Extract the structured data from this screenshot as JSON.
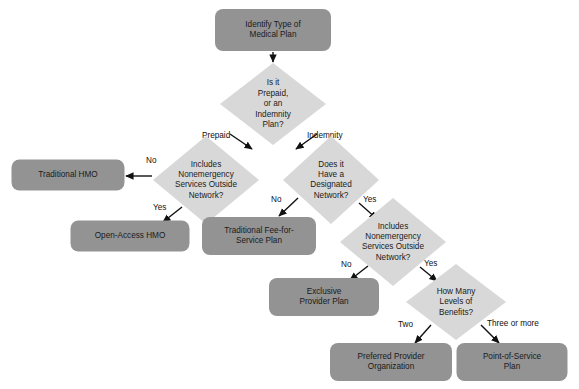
{
  "diagram": {
    "colors": {
      "background": "#ffffff",
      "terminal_fill": "#939393",
      "decision_fill": "#d8d8d8",
      "text": "#1a1a1a",
      "connector": "#111111"
    },
    "nodes": [
      {
        "id": "start",
        "type": "terminal",
        "lines": [
          "Identify Type of",
          "Medical Plan"
        ],
        "x": 273,
        "y": 30,
        "w": 116,
        "h": 42
      },
      {
        "id": "d1",
        "type": "decision",
        "lines": [
          "Is it",
          "Prepaid,",
          "or an",
          "Indemnity",
          "Plan?"
        ],
        "x": 273,
        "y": 104,
        "rx": 53,
        "ry": 41
      },
      {
        "id": "d2",
        "type": "decision",
        "lines": [
          "Includes",
          "Nonemergency",
          "Services Outside",
          "Network?"
        ],
        "x": 206,
        "y": 180,
        "rx": 53,
        "ry": 44
      },
      {
        "id": "d3",
        "type": "decision",
        "lines": [
          "Does it",
          "Have a",
          "Designated",
          "Network?"
        ],
        "x": 331,
        "y": 180,
        "rx": 48,
        "ry": 44
      },
      {
        "id": "trad-hmo",
        "type": "terminal",
        "lines": [
          "Traditional HMO"
        ],
        "x": 68,
        "y": 175,
        "w": 113,
        "h": 31
      },
      {
        "id": "open-hmo",
        "type": "terminal",
        "lines": [
          "Open-Access HMO"
        ],
        "x": 130,
        "y": 236,
        "w": 119,
        "h": 31
      },
      {
        "id": "ffs",
        "type": "terminal",
        "lines": [
          "Traditional Fee-for-",
          "Service Plan"
        ],
        "x": 259,
        "y": 236,
        "w": 114,
        "h": 38
      },
      {
        "id": "d4",
        "type": "decision",
        "lines": [
          "Includes",
          "Nonemergency",
          "Services Outside",
          "Network?"
        ],
        "x": 393,
        "y": 242,
        "rx": 53,
        "ry": 44
      },
      {
        "id": "epp",
        "type": "terminal",
        "lines": [
          "Exclusive",
          "Provider Plan"
        ],
        "x": 324,
        "y": 297,
        "w": 110,
        "h": 38
      },
      {
        "id": "d5",
        "type": "decision",
        "lines": [
          "How Many",
          "Levels of",
          "Benefits?"
        ],
        "x": 456,
        "y": 302,
        "rx": 50,
        "ry": 38
      },
      {
        "id": "ppo",
        "type": "terminal",
        "lines": [
          "Preferred Provider",
          "Organization"
        ],
        "x": 391,
        "y": 362,
        "w": 122,
        "h": 38
      },
      {
        "id": "pos",
        "type": "terminal",
        "lines": [
          "Point-of-Service",
          "Plan"
        ],
        "x": 512,
        "y": 362,
        "w": 111,
        "h": 38
      }
    ],
    "edges": [
      {
        "id": "e-start-d1",
        "from": "start",
        "to": "d1",
        "path": "M 273 52 L 273 62",
        "label": ""
      },
      {
        "id": "e-d1-d2",
        "from": "d1",
        "to": "d2",
        "path": "M 230 134 L 252 149",
        "label": "Prepaid",
        "label_x": 202,
        "label_y": 136
      },
      {
        "id": "e-d1-d3",
        "from": "d1",
        "to": "d3",
        "path": "M 317 134 L 296 149",
        "label": "Indemnity",
        "label_x": 307,
        "label_y": 136
      },
      {
        "id": "e-d2-tradhmo",
        "from": "d2",
        "to": "trad-hmo",
        "path": "M 152 176 L 126 176",
        "label": "No",
        "label_x": 146,
        "label_y": 161
      },
      {
        "id": "e-d2-openhmo",
        "from": "d2",
        "to": "open-hmo",
        "path": "M 182 207 L 163 222",
        "label": "Yes",
        "label_x": 153,
        "label_y": 208
      },
      {
        "id": "e-d3-ffs",
        "from": "d3",
        "to": "ffs",
        "path": "M 298 198 L 279 216",
        "label": "No",
        "label_x": 271,
        "label_y": 200
      },
      {
        "id": "e-d3-d4",
        "from": "d3",
        "to": "d4",
        "path": "M 359 203 L 377 219",
        "label": "Yes",
        "label_x": 363,
        "label_y": 200
      },
      {
        "id": "e-d4-epp",
        "from": "d4",
        "to": "epp",
        "path": "M 368 266 L 350 280",
        "label": "No",
        "label_x": 341,
        "label_y": 265
      },
      {
        "id": "e-d4-d5",
        "from": "d4",
        "to": "d5",
        "path": "M 420 267 L 437 281",
        "label": "Yes",
        "label_x": 424,
        "label_y": 264
      },
      {
        "id": "e-d5-ppo",
        "from": "d5",
        "to": "ppo",
        "path": "M 431 325 L 415 343",
        "label": "Two",
        "label_x": 398,
        "label_y": 325
      },
      {
        "id": "e-d5-pos",
        "from": "d5",
        "to": "pos",
        "path": "M 481 325 L 499 343",
        "label": "Three or more",
        "label_x": 487,
        "label_y": 324
      }
    ]
  }
}
